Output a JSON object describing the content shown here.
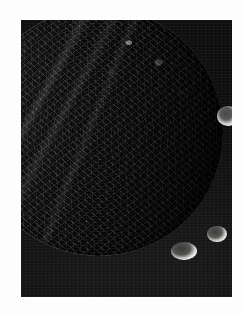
{
  "page": {
    "background_color": "#fdfdfd",
    "width": 242,
    "height": 314
  },
  "photo": {
    "caption": "",
    "subject": "icy cratered moon",
    "frame_color": "#0e0e0e",
    "frame": {
      "left": 21,
      "top": 20,
      "width": 211,
      "height": 277
    },
    "colorspace": "grayscale",
    "illumination": "sunlit from the left, terminator on the right limb",
    "tones": {
      "sky_black": "#0e0e0e",
      "limb_highlight": "#f4f4f2",
      "midtone_gray": "#9a9a98",
      "shadow_gray": "#3e3e3d",
      "paper_white": "#fdfdfd"
    },
    "disk": {
      "center_x": 78,
      "center_y": 112,
      "radius": 124,
      "phase": "gibbous"
    },
    "features": [
      {
        "name": "bright-rimmed-crater",
        "position": "upper-right quadrant",
        "x": 196,
        "y": 86,
        "diameter_px": 22
      },
      {
        "name": "large-crater-lower-left",
        "position": "lower-central",
        "x": 150,
        "y": 222,
        "diameter_px": 26
      },
      {
        "name": "large-crater-lower-right",
        "position": "lower-right",
        "x": 186,
        "y": 206,
        "diameter_px": 20
      },
      {
        "name": "smooth-bright-plain",
        "position": "western sunlit limb",
        "x": 30,
        "y": 140,
        "diameter_px": 70
      },
      {
        "name": "groove-system",
        "position": "diagonal NW-SE across bright hemisphere",
        "x": 70,
        "y": 120,
        "diameter_px": 0
      }
    ]
  }
}
